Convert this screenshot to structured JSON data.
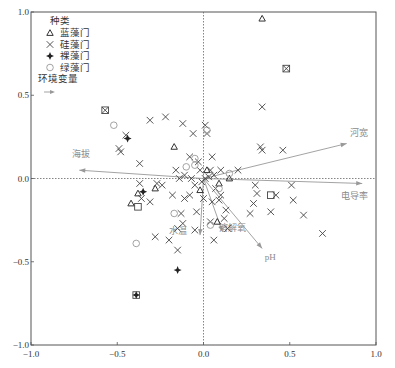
{
  "chart_data": {
    "type": "scatter",
    "subtype": "CCA/RDA ordination biplot",
    "title": "",
    "xlabel": "",
    "ylabel": "",
    "xlim": [
      -1.0,
      1.0
    ],
    "ylim": [
      -1.0,
      1.0
    ],
    "x_ticks": [
      "-1.0",
      "-0.5",
      "0.0",
      "0.5",
      "1.0"
    ],
    "y_ticks": [
      "1.0",
      "0.5",
      "0.0",
      "-0.5",
      "-1.0"
    ],
    "grid": false,
    "zero_lines": "dotted",
    "legend": {
      "position": "upper-left",
      "title": "种类",
      "entries": [
        {
          "label": "蓝藻门",
          "marker": "triangle"
        },
        {
          "label": "硅藻门",
          "marker": "x"
        },
        {
          "label": "裸藻门",
          "marker": "filled-plus"
        },
        {
          "label": "绿藻门",
          "marker": "circle"
        }
      ],
      "env_title": "环境变量",
      "env_marker": "arrow"
    },
    "env_vectors": [
      {
        "name": "河宽",
        "x": 0.83,
        "y": 0.21
      },
      {
        "name": "电导率",
        "x": 0.92,
        "y": -0.03
      },
      {
        "name": "海拔",
        "x": -0.72,
        "y": 0.05
      },
      {
        "name": "水温",
        "x": -0.02,
        "y": -0.34
      },
      {
        "name": "溶解氧",
        "x": 0.11,
        "y": -0.32
      },
      {
        "name": "pH",
        "x": 0.34,
        "y": -0.42
      }
    ],
    "series": [
      {
        "name": "蓝藻门",
        "marker": "triangle",
        "points": [
          [
            0.34,
            0.96
          ],
          [
            0.02,
            0.05
          ],
          [
            -0.17,
            0.19
          ],
          [
            -0.38,
            -0.09
          ],
          [
            -0.42,
            -0.15
          ],
          [
            -0.28,
            -0.06
          ],
          [
            0.09,
            -0.03
          ],
          [
            -0.02,
            -0.07
          ],
          [
            0.08,
            -0.26
          ],
          [
            0.15,
            0.0
          ]
        ]
      },
      {
        "name": "硅藻门",
        "marker": "x",
        "points": [
          [
            0.48,
            0.66
          ],
          [
            -0.57,
            0.41
          ],
          [
            -0.45,
            0.26
          ],
          [
            -0.49,
            0.18
          ],
          [
            -0.48,
            0.16
          ],
          [
            -0.37,
            0.09
          ],
          [
            -0.31,
            0.35
          ],
          [
            -0.22,
            0.37
          ],
          [
            -0.12,
            0.33
          ],
          [
            -0.06,
            0.27
          ],
          [
            0.01,
            0.32
          ],
          [
            0.02,
            0.27
          ],
          [
            0.34,
            0.43
          ],
          [
            0.33,
            0.19
          ],
          [
            0.34,
            0.17
          ],
          [
            0.46,
            0.17
          ],
          [
            0.2,
            0.05
          ],
          [
            0.3,
            -0.04
          ],
          [
            0.31,
            -0.09
          ],
          [
            0.51,
            -0.04
          ],
          [
            0.42,
            -0.1
          ],
          [
            0.52,
            -0.13
          ],
          [
            0.58,
            -0.22
          ],
          [
            0.69,
            -0.33
          ],
          [
            0.39,
            -0.2
          ],
          [
            0.29,
            -0.15
          ],
          [
            0.27,
            -0.21
          ],
          [
            -0.37,
            -0.03
          ],
          [
            -0.36,
            -0.12
          ],
          [
            -0.27,
            -0.03
          ],
          [
            -0.24,
            -0.04
          ],
          [
            -0.16,
            0.05
          ],
          [
            -0.14,
            0.0
          ],
          [
            -0.18,
            -0.1
          ],
          [
            -0.11,
            -0.12
          ],
          [
            -0.13,
            -0.21
          ],
          [
            -0.15,
            -0.3
          ],
          [
            -0.2,
            -0.37
          ],
          [
            -0.28,
            -0.35
          ],
          [
            -0.05,
            -0.31
          ],
          [
            0.04,
            -0.26
          ],
          [
            0.12,
            -0.24
          ],
          [
            0.14,
            -0.3
          ],
          [
            0.05,
            -0.14
          ],
          [
            0.0,
            -0.12
          ],
          [
            -0.04,
            -0.2
          ],
          [
            -0.08,
            -0.1
          ],
          [
            0.1,
            -0.1
          ],
          [
            0.07,
            -0.06
          ],
          [
            -0.02,
            0.05
          ],
          [
            -0.08,
            0.13
          ],
          [
            -0.03,
            0.1
          ],
          [
            0.05,
            0.13
          ],
          [
            0.04,
            0.05
          ],
          [
            -0.11,
            0.02
          ],
          [
            -0.07,
            0.0
          ],
          [
            0.01,
            0.0
          ],
          [
            0.03,
            0.01
          ],
          [
            -0.01,
            -0.02
          ],
          [
            -0.05,
            -0.04
          ],
          [
            0.06,
            0.02
          ],
          [
            0.1,
            0.05
          ],
          [
            0.09,
            -0.13
          ],
          [
            0.13,
            -0.19
          ],
          [
            -0.31,
            -0.14
          ],
          [
            0.06,
            -0.37
          ],
          [
            -0.15,
            -0.43
          ],
          [
            -0.12,
            -0.27
          ]
        ]
      },
      {
        "name": "裸藻门",
        "marker": "filled-plus",
        "points": [
          [
            -0.15,
            -0.55
          ],
          [
            -0.39,
            -0.7
          ],
          [
            -0.44,
            0.24
          ],
          [
            -0.35,
            -0.08
          ]
        ]
      },
      {
        "name": "绿藻门",
        "marker": "circle",
        "points": [
          [
            -0.52,
            0.32
          ],
          [
            -0.39,
            -0.39
          ],
          [
            0.02,
            0.29
          ],
          [
            -0.05,
            0.08
          ],
          [
            0.15,
            0.03
          ],
          [
            -0.17,
            -0.21
          ],
          [
            0.04,
            -0.28
          ],
          [
            -0.05,
            0.12
          ],
          [
            -0.1,
            0.07
          ],
          [
            0.09,
            -0.06
          ]
        ]
      }
    ],
    "special_points": [
      {
        "note": "boxed x (overlapping x and square)",
        "points": [
          [
            0.48,
            0.66
          ],
          [
            -0.57,
            0.41
          ],
          [
            -0.38,
            -0.17
          ],
          [
            0.39,
            -0.1
          ],
          [
            -0.39,
            -0.7
          ]
        ]
      }
    ]
  }
}
